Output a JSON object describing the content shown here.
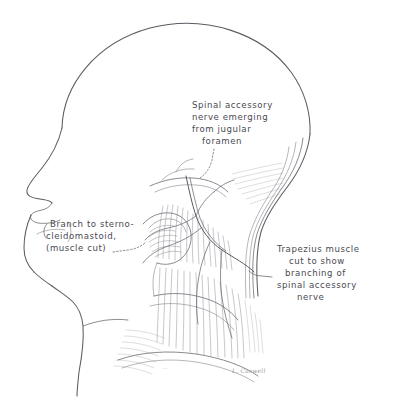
{
  "figure": {
    "view": "left lateral profile of head and neck",
    "medium": "pen-and-ink line drawing with hatched shading",
    "background_color": "#ffffff",
    "ink_color": "#5b5b63",
    "hatch_color": "#6e6e77",
    "width": 394,
    "height": 397
  },
  "labels": {
    "spinal_accessory": {
      "lines": [
        "Spinal accessory",
        "nerve emerging",
        "from jugular",
        "foramen"
      ],
      "full_text": "Spinal accessory nerve emerging from jugular foramen",
      "position": "upper center",
      "leader": "dotted line descending to jugular foramen region"
    },
    "sternocleidomastoid_branch": {
      "lines": [
        "Branch to sterno-",
        "cleidomastoid,",
        "(muscle cut)"
      ],
      "full_text": "Branch to sternocleidomastoid, (muscle cut)",
      "position": "left, over the jaw",
      "leader": "dotted line running right to the cut muscle stump"
    },
    "trapezius": {
      "lines": [
        "Trapezius muscle",
        "cut to show",
        "branching of",
        "spinal accessory",
        "nerve"
      ],
      "full_text": "Trapezius muscle cut to show branching of spinal accessory nerve",
      "position": "right of neck",
      "leader": "short dash to the reflected trapezius edge"
    }
  },
  "signatures": [
    {
      "text": "L. Caswell",
      "position": "lower right of neck"
    },
    {
      "text": "—",
      "position": "lower center, faint"
    }
  ],
  "anatomy": [
    {
      "name": "cranial-vault",
      "description": "smooth domed outline of the skull"
    },
    {
      "name": "facial-profile",
      "description": "forehead, nose, lips and chin contour"
    },
    {
      "name": "mandible-and-neck-contour",
      "description": "jawline sweeping to anterior neck and chest"
    },
    {
      "name": "sternocleidomastoid-stump",
      "description": "cut belly of the sternocleidomastoid muscle"
    },
    {
      "name": "trapezius-muscle",
      "description": "reflected trapezius with long striations"
    },
    {
      "name": "posterior-triangle",
      "description": "hatched muscular field of the posterior cervical triangle"
    },
    {
      "name": "spinal-accessory-nerve",
      "description": "nerve cord curving across the posterior triangle"
    },
    {
      "name": "nerve-branches",
      "description": "fine branches descending into trapezius"
    }
  ]
}
